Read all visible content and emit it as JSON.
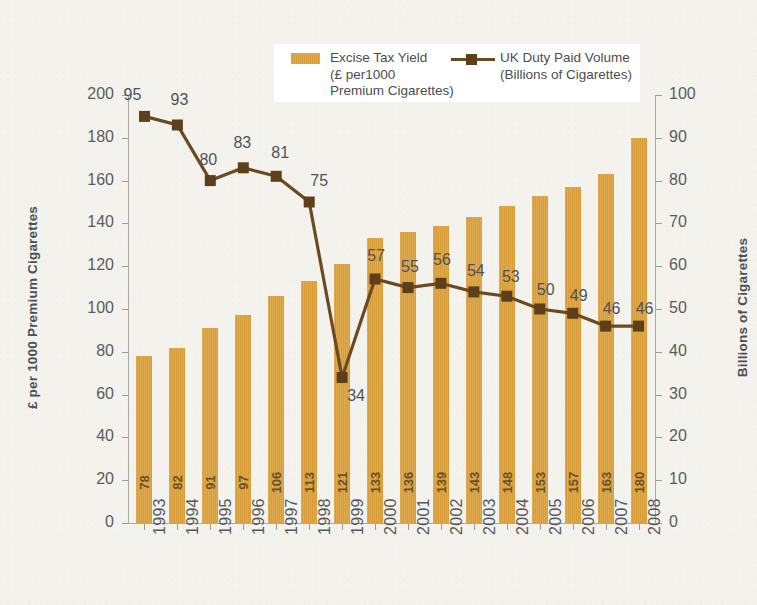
{
  "chart_data": {
    "type": "bar",
    "title": "",
    "subtitle": "",
    "categories": [
      "1993",
      "1994",
      "1995",
      "1996",
      "1997",
      "1998",
      "1999",
      "2000",
      "2001",
      "2002",
      "2003",
      "2004",
      "2005",
      "2006",
      "2007",
      "2008"
    ],
    "xlabel": "",
    "ylabel": "£ per 1000 Premium Cigarettes",
    "ylabel_right": "Billions of Cigarettes",
    "ylim": [
      0,
      200
    ],
    "ylim_right": [
      0,
      100
    ],
    "yticks": [
      0,
      20,
      40,
      60,
      80,
      100,
      120,
      140,
      160,
      180,
      200
    ],
    "yticks_right": [
      0,
      10,
      20,
      30,
      40,
      50,
      60,
      70,
      80,
      90,
      100
    ],
    "grid": false,
    "legend_position": "top-center",
    "series": [
      {
        "name": "Excise Tax Yield",
        "name_detail": "(£ per1000\nPremium Cigarettes)",
        "type": "bar",
        "axis": "left",
        "color": "#dda23c",
        "values": [
          78,
          82,
          91,
          97,
          106,
          113,
          121,
          133,
          136,
          139,
          143,
          148,
          153,
          157,
          163,
          180
        ]
      },
      {
        "name": "UK Duty Paid Volume",
        "name_detail": "(Billions of Cigarettes)",
        "type": "line",
        "axis": "right",
        "color": "#6a4a22",
        "marker_color": "#5d3f1c",
        "values": [
          95,
          93,
          80,
          83,
          81,
          75,
          34,
          57,
          55,
          56,
          54,
          53,
          50,
          49,
          46,
          46
        ]
      }
    ]
  },
  "legend": {
    "bar_text": "Excise Tax Yield\n(£ per1000\nPremium Cigarettes)",
    "line_text": "UK Duty Paid Volume\n(Billions of Cigarettes)"
  },
  "axes": {
    "left_title": "£ per 1000 Premium Cigarettes",
    "right_title": "Billions of Cigarettes"
  }
}
